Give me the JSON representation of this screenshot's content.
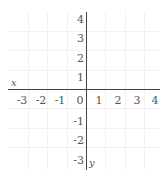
{
  "diagram": {
    "type": "coordinate-plane",
    "x_axis": {
      "label": "x",
      "ticks": [
        "-3",
        "-2",
        "-1",
        "0",
        "1",
        "2",
        "3",
        "4"
      ]
    },
    "y_axis": {
      "label": "y",
      "ticks_positive": [
        "4",
        "3",
        "2",
        "1"
      ],
      "ticks_negative": [
        "-1",
        "-2",
        "-3"
      ]
    },
    "colors": {
      "axis": "#444444",
      "grid": "#f1f1f1",
      "text": "#555555"
    }
  }
}
